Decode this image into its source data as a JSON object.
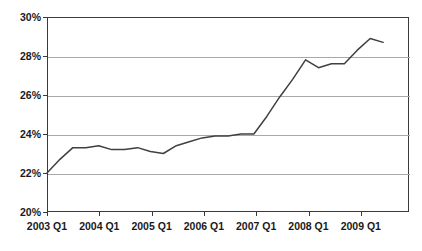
{
  "chart_data": {
    "type": "line",
    "title": "",
    "xlabel": "",
    "ylabel": "",
    "ylim": [
      20,
      30
    ],
    "ytick_labels": [
      "30%",
      "28%",
      "26%",
      "24%",
      "22%",
      "20%"
    ],
    "ytick_values": [
      30,
      28,
      26,
      24,
      22,
      20
    ],
    "xtick_labels": [
      "2003 Q1",
      "2004 Q1",
      "2005 Q1",
      "2006 Q1",
      "2007 Q1",
      "2008 Q1",
      "2009 Q1"
    ],
    "grid": true,
    "legend": "none",
    "line_color": "#404040",
    "x": [
      "2003 Q1",
      "2003 Q2",
      "2003 Q3",
      "2003 Q4",
      "2004 Q1",
      "2004 Q2",
      "2004 Q3",
      "2004 Q4",
      "2005 Q1",
      "2005 Q2",
      "2005 Q3",
      "2005 Q4",
      "2006 Q1",
      "2006 Q2",
      "2006 Q3",
      "2006 Q4",
      "2007 Q1",
      "2007 Q2",
      "2007 Q3",
      "2007 Q4",
      "2008 Q1",
      "2008 Q2",
      "2008 Q3",
      "2008 Q4",
      "2009 Q1",
      "2009 Q2",
      "2009 Q3"
    ],
    "values": [
      22.0,
      22.7,
      23.3,
      23.3,
      23.4,
      23.2,
      23.2,
      23.3,
      23.1,
      23.0,
      23.4,
      23.6,
      23.8,
      23.9,
      23.9,
      24.0,
      24.0,
      24.9,
      25.9,
      26.8,
      27.8,
      27.4,
      27.6,
      27.6,
      28.3,
      28.9,
      28.7
    ],
    "series": [
      {
        "name": "percentage",
        "values": [
          22.0,
          22.7,
          23.3,
          23.3,
          23.4,
          23.2,
          23.2,
          23.3,
          23.1,
          23.0,
          23.4,
          23.6,
          23.8,
          23.9,
          23.9,
          24.0,
          24.0,
          24.9,
          25.9,
          26.8,
          27.8,
          27.4,
          27.6,
          27.6,
          28.3,
          28.9,
          28.7
        ]
      }
    ]
  },
  "axes": {
    "y_labels": [
      {
        "text": "30%",
        "value": 30
      },
      {
        "text": "28%",
        "value": 28
      },
      {
        "text": "26%",
        "value": 26
      },
      {
        "text": "24%",
        "value": 24
      },
      {
        "text": "22%",
        "value": 22
      },
      {
        "text": "20%",
        "value": 20
      }
    ],
    "x_labels": [
      {
        "text": "2003 Q1"
      },
      {
        "text": "2004 Q1"
      },
      {
        "text": "2005 Q1"
      },
      {
        "text": "2006 Q1"
      },
      {
        "text": "2007 Q1"
      },
      {
        "text": "2008 Q1"
      },
      {
        "text": "2009 Q1"
      }
    ]
  }
}
